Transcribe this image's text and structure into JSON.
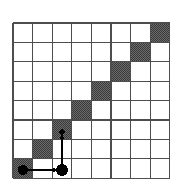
{
  "figure": {
    "name": "grid-diagonal-matrix-figure",
    "canvas": {
      "width": 186,
      "height": 185,
      "background": "#ffffff"
    },
    "grid": {
      "columns": 8,
      "rows": 8,
      "origin_x": 13,
      "origin_y": 23,
      "cell_width": 19.6,
      "cell_height": 19.4,
      "line_color": "#4d4d4d",
      "line_width": 1.1,
      "border_color": "#4d4d4d",
      "border_width": 1.3,
      "empty_cell_color": "#ffffff"
    },
    "shaded_cells": {
      "fill_color": "#5a5a5a",
      "pattern": "dither-checker",
      "description": "anti-diagonal staircase from bottom-left to top-right",
      "cells": [
        {
          "col": 0,
          "row": 7
        },
        {
          "col": 1,
          "row": 6
        },
        {
          "col": 2,
          "row": 5
        },
        {
          "col": 3,
          "row": 4
        },
        {
          "col": 4,
          "row": 3
        },
        {
          "col": 5,
          "row": 2
        },
        {
          "col": 6,
          "row": 1
        },
        {
          "col": 7,
          "row": 0
        }
      ]
    },
    "markers": {
      "color": "#000000",
      "dots": [
        {
          "id": "dot-origin",
          "cx": 23,
          "cy": 170,
          "r": 5.2
        },
        {
          "id": "dot-right",
          "cx": 62,
          "cy": 170,
          "r": 6.0
        },
        {
          "id": "dot-up-tip",
          "cx": 62,
          "cy": 132,
          "r": 2.6
        }
      ]
    },
    "arrows": {
      "color": "#000000",
      "stroke_width": 1.4,
      "items": [
        {
          "id": "arrow-right",
          "direction": "right",
          "x1": 23,
          "y1": 170,
          "x2": 58,
          "y2": 170,
          "head_size": 4.5
        },
        {
          "id": "arrow-up",
          "direction": "up",
          "x1": 62,
          "y1": 168,
          "x2": 62,
          "y2": 134,
          "head_size": 4.5
        }
      ]
    }
  }
}
